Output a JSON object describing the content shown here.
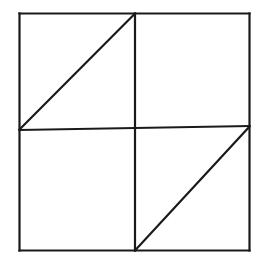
{
  "figure": {
    "name": "pinwheel-square-diagram",
    "type": "line-drawing",
    "canvas": {
      "width": 272,
      "height": 261,
      "background": "#ffffff"
    },
    "stroke": {
      "color": "#1a1a1a",
      "width": 2.2,
      "linecap": "square"
    },
    "square": {
      "label": "outer-square",
      "left": 19.5,
      "top": 13.5,
      "right": 249.5,
      "bottom": 250.5
    },
    "points": {
      "top_left": {
        "x": 19.5,
        "y": 13.5
      },
      "top_mid": {
        "x": 135.0,
        "y": 13.5
      },
      "top_right": {
        "x": 249.5,
        "y": 13.5
      },
      "mid_left": {
        "x": 19.5,
        "y": 130.0
      },
      "center": {
        "x": 135.0,
        "y": 128.0
      },
      "mid_right": {
        "x": 249.5,
        "y": 126.0
      },
      "bottom_left": {
        "x": 19.5,
        "y": 250.5
      },
      "bottom_mid": {
        "x": 135.0,
        "y": 250.5
      },
      "bottom_right": {
        "x": 249.5,
        "y": 250.5
      }
    },
    "segments": [
      {
        "name": "square-top-edge",
        "x1": 19.5,
        "y1": 13.5,
        "x2": 249.5,
        "y2": 13.5
      },
      {
        "name": "square-right-edge",
        "x1": 249.5,
        "y1": 13.5,
        "x2": 249.5,
        "y2": 250.5
      },
      {
        "name": "square-bottom-edge",
        "x1": 249.5,
        "y1": 250.5,
        "x2": 19.5,
        "y2": 250.5
      },
      {
        "name": "square-left-edge",
        "x1": 19.5,
        "y1": 250.5,
        "x2": 19.5,
        "y2": 13.5
      },
      {
        "name": "horizontal-midline",
        "x1": 19.5,
        "y1": 130.0,
        "x2": 249.5,
        "y2": 126.0
      },
      {
        "name": "vertical-midline",
        "x1": 135.0,
        "y1": 13.5,
        "x2": 135.0,
        "y2": 250.5
      },
      {
        "name": "diagonal-top-left",
        "x1": 19.5,
        "y1": 129.5,
        "x2": 135.0,
        "y2": 13.5
      },
      {
        "name": "diagonal-bottom-right",
        "x1": 135.0,
        "y1": 250.5,
        "x2": 249.5,
        "y2": 126.5
      }
    ]
  }
}
